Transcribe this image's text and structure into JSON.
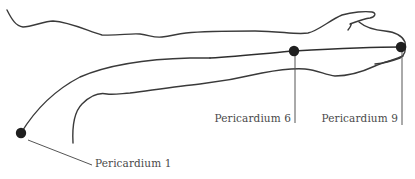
{
  "figure": {
    "meridian": "pericardium"
  },
  "points": [
    {
      "id": "P1",
      "label": "Pericardium 1"
    },
    {
      "id": "P6",
      "label": "Pericardium 6"
    },
    {
      "id": "P9",
      "label": "Pericardium 9"
    }
  ],
  "colors": {
    "outline": "#3a3a3a",
    "point": "#1f1f1f",
    "label": "#4a4a4a",
    "background": "#ffffff"
  }
}
